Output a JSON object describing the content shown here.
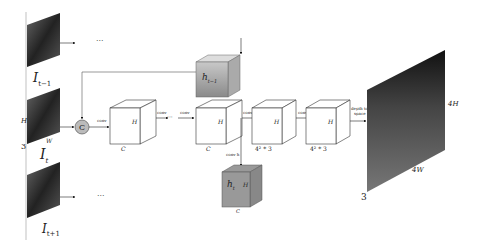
{
  "inputs": {
    "prev": {
      "label": "I",
      "sub": "t−1"
    },
    "cur": {
      "label": "I",
      "sub": "t",
      "dims": {
        "h": "H",
        "w": "W",
        "c": "3"
      }
    },
    "next": {
      "label": "I",
      "sub": "t+1"
    },
    "ellipsis": "···"
  },
  "concat": {
    "symbol": "C"
  },
  "blocks": [
    {
      "op": "conv",
      "h": "H",
      "d": "C"
    },
    {
      "op": "conv",
      "h": "H",
      "d": "C"
    },
    {
      "op": "conv",
      "h": "H",
      "d": "4² * 3"
    },
    {
      "op": "conv",
      "h": "H",
      "d": "4² * 3"
    }
  ],
  "ellipsis_mid": "···",
  "hidden_prev": {
    "label": "h",
    "sub": "t−1"
  },
  "hidden_cur": {
    "label": "h",
    "sub": "t",
    "h": "H",
    "d": "C",
    "op": "conv h"
  },
  "depth_to_space": {
    "line1": "depth to",
    "line2": "space"
  },
  "output": {
    "h": "4H",
    "w": "4W",
    "c": "3"
  }
}
